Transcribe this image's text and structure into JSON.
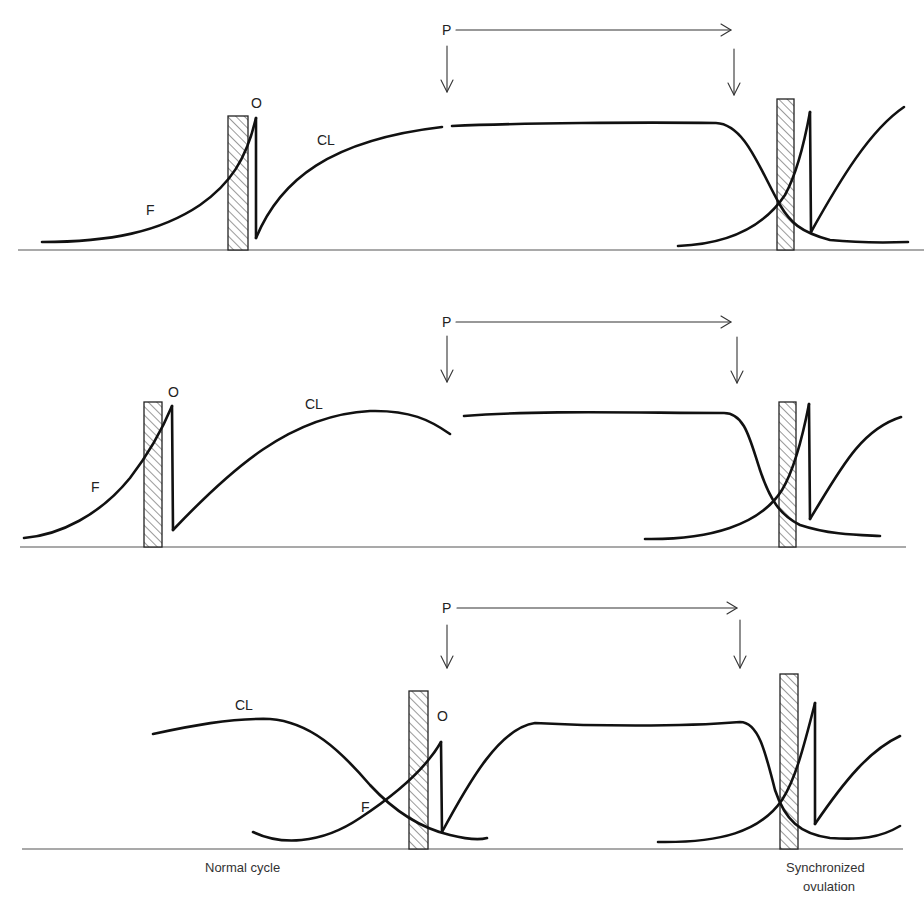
{
  "figure": {
    "colors": {
      "curve": "#111111",
      "axis": "#555555",
      "arrow": "#333333",
      "hatch": "#555555",
      "background": "#ffffff"
    },
    "legend": {
      "F": "Follicle",
      "CL": "Corpus luteum",
      "O": "Ovulation",
      "P": "Progestagen treatment period",
      "hatched_bar": "Oestrus / heat period"
    },
    "panels": [
      {
        "id": "panel-1",
        "labels": {
          "p": "P",
          "o": "O",
          "cl": "CL",
          "f": "F"
        },
        "description": "Treatment started early in luteal phase; CL persists under P until withdrawal"
      },
      {
        "id": "panel-2",
        "labels": {
          "p": "P",
          "o": "O",
          "cl": "CL",
          "f": "F"
        },
        "description": "Treatment started mid luteal phase; natural CL regresses, P maintains plateau"
      },
      {
        "id": "panel-3",
        "labels": {
          "p": "P",
          "o": "O",
          "cl": "CL",
          "f": "F"
        },
        "description": "Treatment started at ovulation; new CL forms then P maintains plateau"
      }
    ],
    "captions": {
      "normal_cycle": "Normal cycle",
      "synchronized_line1": "Synchronized",
      "synchronized_line2": "ovulation"
    }
  }
}
